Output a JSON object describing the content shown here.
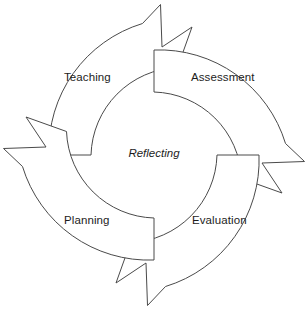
{
  "diagram": {
    "type": "cycle",
    "center_label": "Reflecting",
    "background_color": "#ffffff",
    "stroke_color": "#4a4a4a",
    "fill_color": "#ffffff",
    "stages": [
      {
        "id": "teaching",
        "label": "Teaching",
        "position": "upper-left",
        "arrow_direction": "up-right"
      },
      {
        "id": "assessment",
        "label": "Assessment",
        "position": "upper-right",
        "arrow_direction": "down-right"
      },
      {
        "id": "evaluation",
        "label": "Evaluation",
        "position": "lower-right",
        "arrow_direction": "down-left"
      },
      {
        "id": "planning",
        "label": "Planning",
        "position": "lower-left",
        "arrow_direction": "up-left"
      }
    ],
    "geometry": {
      "center_x": 154,
      "center_y": 155,
      "outer_radius": 131,
      "inner_radius": 63
    }
  }
}
